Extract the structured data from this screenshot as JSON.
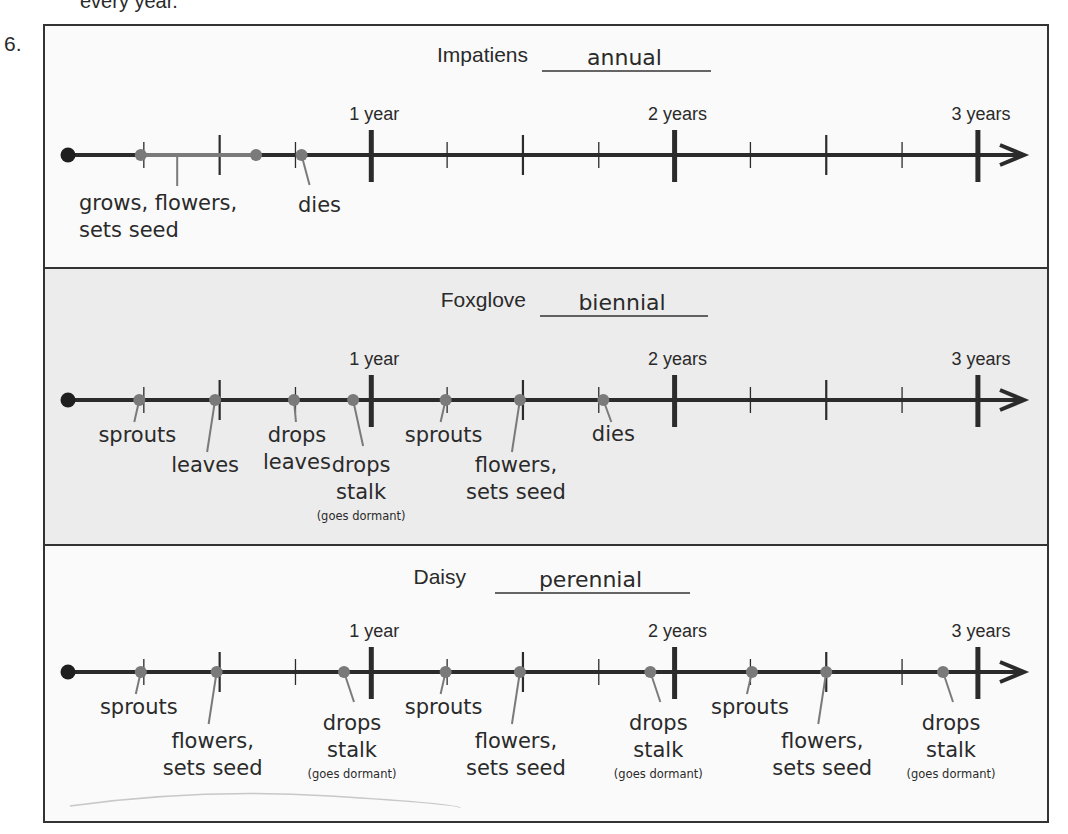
{
  "question_number": "6.",
  "header_fragment": "every year.",
  "colors": {
    "axis": "#2b2b2b",
    "event": "#7a7a7a",
    "panel_plain": "#fafafa",
    "panel_shaded": "#ececec",
    "border": "#333333"
  },
  "year_labels": [
    "1 year",
    "2 years",
    "3 years"
  ],
  "panels": [
    {
      "plant": "Impatiens",
      "answer": "annual",
      "shaded": false,
      "events": [
        {
          "at_years": 0.24,
          "label": [],
          "role": "span-start"
        },
        {
          "at_years": 0.62,
          "label": [],
          "role": "span-end"
        },
        {
          "at_years": 0.36,
          "label": [
            "grows, flowers,",
            "sets seed"
          ],
          "role": "span-label",
          "span": [
            0.24,
            0.62
          ]
        },
        {
          "at_years": 0.77,
          "label": [
            "dies"
          ]
        }
      ]
    },
    {
      "plant": "Foxglove",
      "answer": "biennial",
      "shaded": true,
      "events": [
        {
          "at_years": 0.235,
          "label": [
            "sprouts"
          ]
        },
        {
          "at_years": 0.485,
          "label": [
            "leaves"
          ]
        },
        {
          "at_years": 0.745,
          "label": [
            "drops",
            "leaves"
          ]
        },
        {
          "at_years": 0.94,
          "label": [
            "drops",
            "stalk"
          ],
          "note": "(goes dormant)"
        },
        {
          "at_years": 1.245,
          "label": [
            "sprouts"
          ]
        },
        {
          "at_years": 1.49,
          "label": [
            "flowers,",
            "sets seed"
          ]
        },
        {
          "at_years": 1.765,
          "label": [
            "dies"
          ]
        }
      ]
    },
    {
      "plant": "Daisy",
      "answer": "perennial",
      "shaded": false,
      "events": [
        {
          "at_years": 0.24,
          "label": [
            "sprouts"
          ]
        },
        {
          "at_years": 0.49,
          "label": [
            "flowers,",
            "sets seed"
          ]
        },
        {
          "at_years": 0.91,
          "label": [
            "drops",
            "stalk"
          ],
          "note": "(goes dormant)"
        },
        {
          "at_years": 1.245,
          "label": [
            "sprouts"
          ]
        },
        {
          "at_years": 1.49,
          "label": [
            "flowers,",
            "sets seed"
          ]
        },
        {
          "at_years": 1.92,
          "label": [
            "drops",
            "stalk"
          ],
          "note": "(goes dormant)"
        },
        {
          "at_years": 2.255,
          "label": [
            "sprouts"
          ]
        },
        {
          "at_years": 2.5,
          "label": [
            "flowers,",
            "sets seed"
          ]
        },
        {
          "at_years": 2.885,
          "label": [
            "drops",
            "stalk"
          ],
          "note": "(goes dormant)"
        }
      ]
    }
  ]
}
